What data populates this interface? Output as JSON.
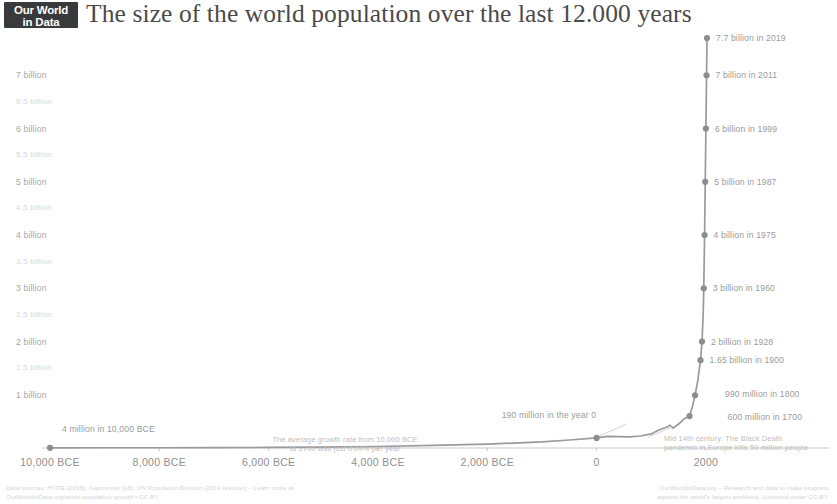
{
  "header": {
    "logo_line1": "Our World",
    "logo_line2": "in Data",
    "title": "The size of the world population over the last 12.000 years"
  },
  "chart_data": {
    "type": "line",
    "title": "The size of the world population over the last 12.000 years",
    "xlabel": "",
    "ylabel": "",
    "xlim": [
      -10000,
      2019
    ],
    "ylim": [
      0,
      7700
    ],
    "grid": false,
    "legend_position": "none",
    "y_unit": "million people",
    "y_ticks": [
      {
        "value": 7000,
        "label": "7 billion",
        "kind": "major"
      },
      {
        "value": 6500,
        "label": "6.5 billion",
        "kind": "minor"
      },
      {
        "value": 6000,
        "label": "6 billion",
        "kind": "major"
      },
      {
        "value": 5500,
        "label": "5.5 billion",
        "kind": "minor"
      },
      {
        "value": 5000,
        "label": "5 billion",
        "kind": "major"
      },
      {
        "value": 4500,
        "label": "4.5 billion",
        "kind": "minor"
      },
      {
        "value": 4000,
        "label": "4 billion",
        "kind": "major"
      },
      {
        "value": 3500,
        "label": "3.5 billion",
        "kind": "minor"
      },
      {
        "value": 3000,
        "label": "3 billion",
        "kind": "major"
      },
      {
        "value": 2500,
        "label": "2.5 billion",
        "kind": "minor"
      },
      {
        "value": 2000,
        "label": "2 billion",
        "kind": "major"
      },
      {
        "value": 1500,
        "label": "1.5 billion",
        "kind": "minor"
      },
      {
        "value": 1000,
        "label": "1 billion",
        "kind": "major"
      }
    ],
    "x_ticks": [
      {
        "value": -10000,
        "label": "10,000 BCE"
      },
      {
        "value": -8000,
        "label": "8,000 BCE"
      },
      {
        "value": -6000,
        "label": "6,000 BCE"
      },
      {
        "value": -4000,
        "label": "4,000 BCE"
      },
      {
        "value": -2000,
        "label": "2,000 BCE"
      },
      {
        "value": 0,
        "label": "0"
      },
      {
        "value": 2000,
        "label": "2000"
      }
    ],
    "series": [
      {
        "name": "World population",
        "color": "#9a9a9a",
        "x": [
          -10000,
          -9000,
          -8000,
          -7000,
          -6000,
          -5000,
          -4000,
          -3000,
          -2000,
          -1000,
          -500,
          0,
          200,
          400,
          600,
          800,
          1000,
          1100,
          1200,
          1300,
          1340,
          1400,
          1500,
          1600,
          1700,
          1750,
          1800,
          1850,
          1900,
          1928,
          1950,
          1960,
          1975,
          1987,
          1999,
          2011,
          2019
        ],
        "values": [
          4,
          5,
          5,
          7,
          10,
          15,
          28,
          50,
          72,
          115,
          150,
          190,
          220,
          215,
          210,
          225,
          265,
          320,
          360,
          400,
          429,
          375,
          450,
          545,
          600,
          770,
          990,
          1260,
          1650,
          2000,
          2536,
          3000,
          4000,
          5000,
          6000,
          7000,
          7700
        ]
      }
    ],
    "markers": [
      {
        "x": -10000,
        "y": 4,
        "label": "4 million in 10,000 BCE"
      },
      {
        "x": 0,
        "y": 190,
        "label": "190 million in the year 0"
      },
      {
        "x": 1700,
        "y": 600,
        "label": "600 million in 1700"
      },
      {
        "x": 1800,
        "y": 990,
        "label": "990 million in 1800"
      },
      {
        "x": 1900,
        "y": 1650,
        "label": "1.65 billion in 1900"
      },
      {
        "x": 1928,
        "y": 2000,
        "label": "2 billion in 1928"
      },
      {
        "x": 1960,
        "y": 3000,
        "label": "3 billion in 1960"
      },
      {
        "x": 1975,
        "y": 4000,
        "label": "4 billion in 1975"
      },
      {
        "x": 1987,
        "y": 5000,
        "label": "5 billion in 1987"
      },
      {
        "x": 1999,
        "y": 6000,
        "label": "6 billion in 1999"
      },
      {
        "x": 2011,
        "y": 7000,
        "label": "7 billion in 2011"
      },
      {
        "x": 2019,
        "y": 7700,
        "label": "7.7 billion in 2019"
      }
    ],
    "annotations": [
      {
        "name": "growth-rate-note",
        "lines": [
          "The average growth rate from 10,000 BCE",
          "to 1700 was just 0.04% per year"
        ]
      },
      {
        "name": "black-death-note",
        "lines": [
          "Mid 14th century: The Black Death",
          "pandemic in Europe kills 50 million people"
        ]
      }
    ]
  },
  "footer": {
    "line1": "Data sources: HYDE (2016); Gapminder (v6); UN Population Division (2019 revision)  –  Learn more at",
    "line2": "OurWorldInData.org/world-population-growth  •  CC BY",
    "line3": "OurWorldInData.org  –  Research and data to make progress",
    "line4": "against the world's largest problems.  Licensed under CC-BY."
  }
}
